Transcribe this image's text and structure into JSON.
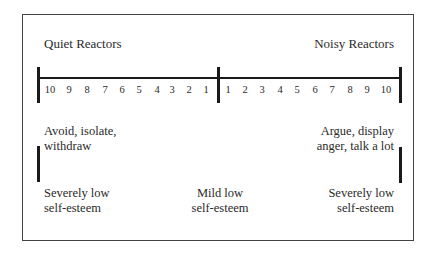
{
  "diagram": {
    "left_title": "Quiet Reactors",
    "right_title": "Noisy Reactors",
    "left_scale": [
      "10",
      "9",
      "8",
      "7",
      "6",
      "5",
      "4",
      "3",
      "2",
      "1"
    ],
    "right_scale": [
      "1",
      "2",
      "3",
      "4",
      "5",
      "6",
      "7",
      "8",
      "9",
      "10"
    ],
    "left_behavior": {
      "line1": "Avoid, isolate,",
      "line2": "withdraw"
    },
    "right_behavior": {
      "line1": "Argue, display",
      "line2": "anger, talk a lot"
    },
    "self_esteem": {
      "left": {
        "line1": "Severely low",
        "line2": "self-esteem"
      },
      "center": {
        "line1": "Mild low",
        "line2": "self-esteem"
      },
      "right": {
        "line1": "Severely low",
        "line2": "self-esteem"
      }
    },
    "colors": {
      "line": "#1a1a1a",
      "text": "#2a2a2a",
      "border": "#444444"
    }
  }
}
